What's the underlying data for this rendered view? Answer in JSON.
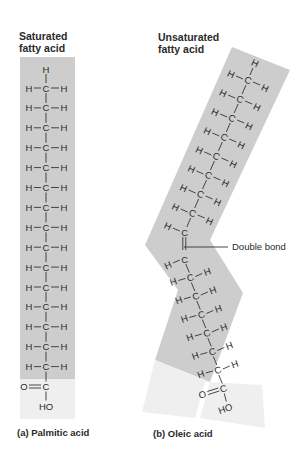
{
  "saturated": {
    "title_line1": "Saturated",
    "title_line2": "fatty acid",
    "caption": "(a) Palmitic acid",
    "ch2_rows": 15,
    "carboxyl": {
      "carbonyl": "O",
      "carbon": "C",
      "hydroxyl": "HO"
    }
  },
  "unsaturated": {
    "title_line1": "Unsaturated",
    "title_line2": "fatty acid",
    "caption": "(b) Oleic acid",
    "upper_rows": 8,
    "lower_rows": 6,
    "double_bond_label": "Double bond",
    "carboxyl": {
      "carbonyl": "O",
      "carbon": "C",
      "hydroxyl": "HO"
    }
  },
  "atoms": {
    "hydrogen": "H",
    "carbon": "C"
  },
  "colors": {
    "chain_band": "#cdcdcd",
    "carboxyl_band": "#efefef",
    "text": "#2a2a2a"
  }
}
